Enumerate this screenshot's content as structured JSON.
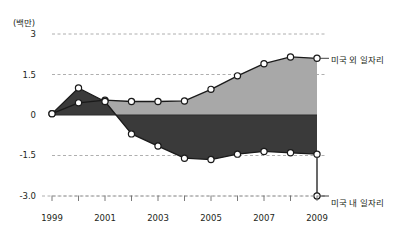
{
  "chart_data": {
    "type": "area",
    "title": "",
    "subtitle": "",
    "xlabel": "",
    "ylabel": "",
    "unit_label": "(백만)",
    "grid": true,
    "legend_position": "right-inline",
    "xlim": [
      1999,
      2009
    ],
    "ylim": [
      -3.0,
      3.0
    ],
    "x": [
      1999,
      2000,
      2001,
      2002,
      2003,
      2004,
      2005,
      2006,
      2007,
      2008,
      2009
    ],
    "xtick_labels": [
      "1999",
      "",
      "2001",
      "",
      "2003",
      "",
      "2005",
      "",
      "2007",
      "",
      "2009"
    ],
    "ytick_labels": [
      "3",
      "1.5",
      "0",
      "-1.5",
      "-3.0"
    ],
    "ytick_values": [
      3,
      1.5,
      0,
      -1.5,
      -3.0
    ],
    "series": [
      {
        "name": "미국 외 일자리",
        "color": "#a8a8a8",
        "line_color": "#1a1a1a",
        "marker": "open-circle",
        "values": [
          0.05,
          0.45,
          0.55,
          0.5,
          0.5,
          0.52,
          0.95,
          1.45,
          1.9,
          2.15,
          2.1
        ]
      },
      {
        "name": "미국 내 일자리",
        "color": "#3a3a3a",
        "line_color": "#1a1a1a",
        "marker": "open-circle",
        "values": [
          0.05,
          1.0,
          0.5,
          -0.7,
          -1.15,
          -1.6,
          -1.65,
          -1.45,
          -1.35,
          -1.4,
          -1.45
        ]
      }
    ],
    "series_2_note": "dark series continues to -3.0 at 2009",
    "annotations": [
      {
        "text": "미국 외 일자리",
        "x": 2009,
        "y": 2.1,
        "position": "right"
      },
      {
        "text": "미국 내 일자리",
        "x": 2009,
        "y": -3.0,
        "position": "right"
      }
    ]
  }
}
